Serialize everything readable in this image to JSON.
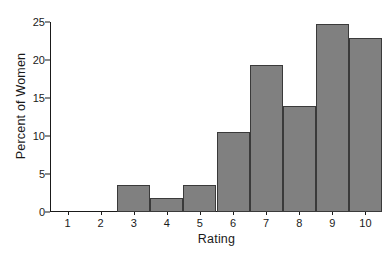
{
  "chart_data": {
    "type": "bar",
    "title": "",
    "xlabel": "Rating",
    "ylabel": "Percent of Women",
    "categories": [
      "1",
      "2",
      "3",
      "4",
      "5",
      "6",
      "7",
      "8",
      "9",
      "10"
    ],
    "values": [
      0,
      0,
      3.6,
      1.9,
      3.6,
      10.5,
      19.3,
      14.0,
      24.7,
      22.9
    ],
    "ylim": [
      0,
      25
    ],
    "yticks": [
      0,
      5,
      10,
      15,
      20,
      25
    ],
    "ytick_labels": [
      "0",
      "5",
      "10",
      "15",
      "20",
      "25"
    ],
    "grid": false,
    "legend": false,
    "bar_color": "#808080",
    "bar_edge_color": "#3a3a3a",
    "axis_color": "#1a1a1a",
    "background_color": "#ffffff"
  }
}
